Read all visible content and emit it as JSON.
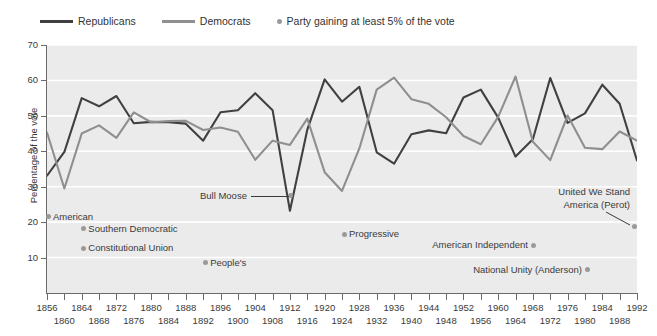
{
  "legend": {
    "items": [
      {
        "label": "Republicans",
        "type": "line",
        "color": "#404040"
      },
      {
        "label": "Democrats",
        "type": "line",
        "color": "#8f8f8f"
      },
      {
        "label": "Party gaining at least 5% of the vote",
        "type": "dot",
        "color": "#9a9a9a"
      }
    ]
  },
  "chart_data": {
    "type": "line",
    "title": "",
    "xlabel": "",
    "ylabel": "Percentage of the vote",
    "xlim": [
      1856,
      1992
    ],
    "ylim": [
      0,
      70
    ],
    "grid": true,
    "legend_position": "top-left",
    "x": [
      1856,
      1860,
      1864,
      1868,
      1872,
      1876,
      1880,
      1884,
      1888,
      1892,
      1896,
      1900,
      1904,
      1908,
      1912,
      1916,
      1920,
      1924,
      1928,
      1932,
      1936,
      1940,
      1944,
      1948,
      1952,
      1956,
      1960,
      1964,
      1968,
      1972,
      1976,
      1980,
      1984,
      1988,
      1992
    ],
    "xticks_row1": [
      1856,
      1864,
      1872,
      1880,
      1888,
      1896,
      1904,
      1912,
      1920,
      1928,
      1936,
      1944,
      1952,
      1960,
      1968,
      1976,
      1984,
      1992
    ],
    "xticks_row2": [
      1860,
      1868,
      1876,
      1884,
      1892,
      1900,
      1908,
      1916,
      1924,
      1932,
      1940,
      1948,
      1956,
      1964,
      1972,
      1980,
      1988
    ],
    "yticks": [
      10,
      20,
      30,
      40,
      50,
      60,
      70
    ],
    "series": [
      {
        "name": "Republicans",
        "color": "#404040",
        "values": [
          33.1,
          39.8,
          55.0,
          52.7,
          55.6,
          47.9,
          48.3,
          48.2,
          47.8,
          43.0,
          51.0,
          51.6,
          56.4,
          51.6,
          23.2,
          46.1,
          60.3,
          54.0,
          58.2,
          39.7,
          36.5,
          44.8,
          45.9,
          45.1,
          55.2,
          57.4,
          49.5,
          38.5,
          43.4,
          60.7,
          48.0,
          50.7,
          58.8,
          53.4,
          37.4
        ]
      },
      {
        "name": "Democrats",
        "color": "#8f8f8f",
        "values": [
          45.3,
          29.5,
          45.0,
          47.3,
          43.8,
          51.0,
          48.2,
          48.5,
          48.6,
          46.0,
          46.7,
          45.5,
          37.6,
          43.0,
          41.8,
          49.2,
          34.1,
          28.8,
          40.8,
          57.4,
          60.8,
          54.7,
          53.4,
          49.6,
          44.3,
          42.0,
          49.7,
          61.1,
          42.7,
          37.5,
          50.1,
          41.0,
          40.6,
          45.6,
          43.0
        ]
      }
    ],
    "annotations": [
      {
        "label": "Bull Moose",
        "year": 1912,
        "value": 27.4,
        "leader": true
      },
      {
        "label": "American",
        "year": 1856,
        "value": 21.5,
        "leader": false
      },
      {
        "label": "Southern Democratic",
        "year": 1860,
        "value": 18.1,
        "leader": false
      },
      {
        "label": "Constitutional Union",
        "year": 1860,
        "value": 12.6,
        "leader": false
      },
      {
        "label": "People's",
        "year": 1892,
        "value": 8.5,
        "leader": false
      },
      {
        "label": "Progressive",
        "year": 1924,
        "value": 16.6,
        "leader": false
      },
      {
        "label": "American Independent",
        "year": 1968,
        "value": 13.5,
        "leader": false
      },
      {
        "label": "National Unity (Anderson)",
        "year": 1980,
        "value": 6.6,
        "leader": false
      },
      {
        "label": "United We Stand America (Perot)",
        "year": 1992,
        "value": 18.9,
        "leader": true
      }
    ]
  },
  "annotations": {
    "bull_moose": "Bull Moose",
    "american": "American",
    "southern_democratic": "Southern Democratic",
    "constitutional_union": "Constitutional Union",
    "peoples": "People's",
    "progressive": "Progressive",
    "american_independent": "American Independent",
    "national_unity": "National Unity (Anderson)",
    "perot_line1": "United We Stand",
    "perot_line2": "America (Perot)"
  },
  "colors": {
    "republican": "#404040",
    "democrat": "#8f8f8f",
    "marker": "#9a9a9a",
    "plot_bg": "#ebebeb",
    "grid": "#ffffff",
    "axis": "#6b6b6b",
    "text": "#3a3a3a"
  }
}
